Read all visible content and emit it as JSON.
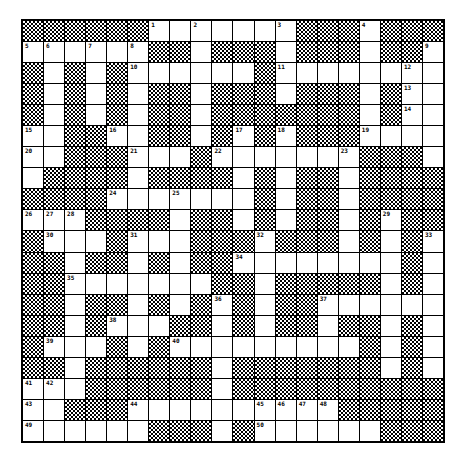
{
  "puzzle": {
    "type": "crossword",
    "size": {
      "cols": 20,
      "rows": 20
    },
    "legend": {
      "B": "block",
      "W": "white",
      "N": "numbered white"
    },
    "colors": {
      "grid_line": "#000000",
      "cell": "#ffffff",
      "block_pattern": "#000000"
    }
  },
  "grid": {
    "rows": [
      [
        "B",
        "B",
        "B",
        "B",
        "B",
        "B",
        "1",
        "W",
        "2",
        "W",
        "W",
        "W",
        "3",
        "B",
        "B",
        "B",
        "4",
        "B",
        "B",
        "B"
      ],
      [
        "5",
        "6",
        "W",
        "7",
        "W",
        "8",
        "B",
        "B",
        "W",
        "B",
        "B",
        "B",
        "W",
        "B",
        "B",
        "B",
        "W",
        "B",
        "B",
        "9"
      ],
      [
        "B",
        "W",
        "B",
        "W",
        "B",
        "10",
        "W",
        "W",
        "W",
        "W",
        "W",
        "B",
        "11",
        "W",
        "W",
        "W",
        "W",
        "W",
        "12",
        "W"
      ],
      [
        "B",
        "W",
        "B",
        "W",
        "B",
        "W",
        "B",
        "B",
        "W",
        "B",
        "B",
        "B",
        "W",
        "B",
        "B",
        "B",
        "W",
        "B",
        "13",
        "W"
      ],
      [
        "B",
        "W",
        "B",
        "W",
        "B",
        "W",
        "B",
        "B",
        "W",
        "B",
        "B",
        "B",
        "B",
        "B",
        "B",
        "B",
        "W",
        "B",
        "14",
        "W"
      ],
      [
        "15",
        "W",
        "B",
        "B",
        "16",
        "W",
        "B",
        "B",
        "W",
        "B",
        "17",
        "B",
        "18",
        "B",
        "B",
        "B",
        "19",
        "W",
        "W",
        "W"
      ],
      [
        "20",
        "W",
        "B",
        "B",
        "B",
        "21",
        "W",
        "W",
        "B",
        "22",
        "W",
        "W",
        "W",
        "W",
        "W",
        "23",
        "B",
        "B",
        "B",
        "W"
      ],
      [
        "W",
        "B",
        "B",
        "B",
        "B",
        "W",
        "B",
        "B",
        "B",
        "B",
        "W",
        "B",
        "W",
        "B",
        "B",
        "W",
        "B",
        "B",
        "B",
        "B"
      ],
      [
        "B",
        "B",
        "B",
        "B",
        "24",
        "W",
        "W",
        "25",
        "W",
        "W",
        "W",
        "B",
        "W",
        "B",
        "B",
        "W",
        "B",
        "B",
        "B",
        "B"
      ],
      [
        "26",
        "27",
        "28",
        "B",
        "B",
        "B",
        "B",
        "W",
        "B",
        "B",
        "W",
        "B",
        "W",
        "B",
        "B",
        "W",
        "B",
        "29",
        "B",
        "B"
      ],
      [
        "B",
        "30",
        "W",
        "W",
        "B",
        "31",
        "W",
        "W",
        "B",
        "B",
        "B",
        "32",
        "B",
        "B",
        "B",
        "W",
        "B",
        "W",
        "B",
        "33"
      ],
      [
        "B",
        "B",
        "W",
        "B",
        "B",
        "W",
        "B",
        "W",
        "B",
        "B",
        "34",
        "W",
        "W",
        "W",
        "W",
        "W",
        "W",
        "W",
        "B",
        "W"
      ],
      [
        "B",
        "B",
        "35",
        "W",
        "W",
        "W",
        "W",
        "W",
        "W",
        "B",
        "B",
        "W",
        "B",
        "B",
        "B",
        "B",
        "B",
        "W",
        "B",
        "W"
      ],
      [
        "B",
        "B",
        "W",
        "B",
        "B",
        "W",
        "B",
        "W",
        "B",
        "36",
        "B",
        "W",
        "B",
        "B",
        "37",
        "W",
        "W",
        "W",
        "W",
        "W"
      ],
      [
        "B",
        "B",
        "W",
        "B",
        "38",
        "W",
        "W",
        "B",
        "B",
        "W",
        "B",
        "W",
        "B",
        "B",
        "W",
        "B",
        "B",
        "W",
        "B",
        "W"
      ],
      [
        "B",
        "39",
        "W",
        "W",
        "B",
        "W",
        "B",
        "40",
        "W",
        "W",
        "W",
        "W",
        "W",
        "W",
        "W",
        "W",
        "B",
        "W",
        "B",
        "W"
      ],
      [
        "B",
        "B",
        "W",
        "B",
        "B",
        "B",
        "B",
        "B",
        "B",
        "W",
        "B",
        "B",
        "B",
        "B",
        "B",
        "B",
        "B",
        "W",
        "B",
        "W"
      ],
      [
        "41",
        "42",
        "W",
        "B",
        "B",
        "B",
        "B",
        "B",
        "B",
        "W",
        "B",
        "B",
        "B",
        "B",
        "B",
        "B",
        "B",
        "B",
        "B",
        "B"
      ],
      [
        "43",
        "W",
        "B",
        "B",
        "B",
        "44",
        "W",
        "W",
        "W",
        "W",
        "W",
        "45",
        "46",
        "47",
        "48",
        "B",
        "B",
        "B",
        "B",
        "B"
      ],
      [
        "49",
        "W",
        "W",
        "W",
        "W",
        "W",
        "B",
        "B",
        "B",
        "W",
        "B",
        "50",
        "W",
        "W",
        "W",
        "W",
        "W",
        "B",
        "B",
        "B"
      ]
    ]
  },
  "clue_numbers": [
    "1",
    "2",
    "3",
    "4",
    "5",
    "6",
    "7",
    "8",
    "9",
    "10",
    "11",
    "12",
    "13",
    "14",
    "15",
    "16",
    "17",
    "18",
    "19",
    "20",
    "21",
    "22",
    "23",
    "24",
    "25",
    "26",
    "27",
    "28",
    "29",
    "30",
    "31",
    "32",
    "33",
    "34",
    "35",
    "36",
    "37",
    "38",
    "39",
    "40",
    "41",
    "42",
    "43",
    "44",
    "45",
    "46",
    "47",
    "48",
    "49",
    "50"
  ]
}
